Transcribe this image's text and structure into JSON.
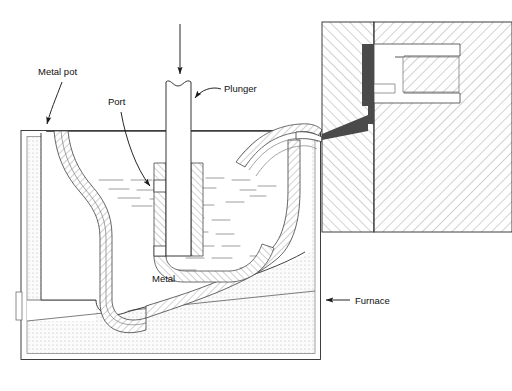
{
  "figure": {
    "type": "technical-cross-section-diagram",
    "background_color": "#ffffff",
    "line_color": "#2b2b2b",
    "hatch_color": "#8f8f8f",
    "sprue_color": "#4a4a4a",
    "stipple_color": "#b9b9b9",
    "liquid_color": "#9a9a9a"
  },
  "labels": [
    {
      "id": "metal-pot",
      "text": "Metal pot",
      "x": 38,
      "y": 75
    },
    {
      "id": "port",
      "text": "Port",
      "x": 108,
      "y": 105
    },
    {
      "id": "plunger",
      "text": "Plunger",
      "x": 224,
      "y": 90
    },
    {
      "id": "metal",
      "text": "Metal",
      "x": 152,
      "y": 280
    },
    {
      "id": "furnace",
      "text": "Furnace",
      "x": 355,
      "y": 303
    }
  ],
  "leaders": [
    {
      "id": "metal-pot-leader",
      "from": [
        62,
        80
      ],
      "to": [
        47,
        128
      ],
      "arrow": "down"
    },
    {
      "id": "port-leader",
      "from": [
        120,
        112
      ],
      "to": [
        152,
        190
      ],
      "arrow": "down-right"
    },
    {
      "id": "plunger-leader",
      "from": [
        220,
        92
      ],
      "to": [
        193,
        99
      ],
      "arrow": "left"
    },
    {
      "id": "furnace-leader",
      "from": [
        350,
        300
      ],
      "to": [
        322,
        300
      ],
      "arrow": "left"
    },
    {
      "id": "plunger-force-arrow",
      "from": [
        180,
        24
      ],
      "to": [
        180,
        78
      ],
      "arrow": "down"
    }
  ],
  "parts": {
    "plunger": {
      "name": "Plunger",
      "top_style": "break-line",
      "x": 165,
      "width": 26
    },
    "gooseneck": {
      "name": "Gooseneck channel",
      "fill": "hatched"
    },
    "port": {
      "name": "Port",
      "description": "inlet opening in gooseneck"
    },
    "metal_pot": {
      "name": "Metal pot",
      "fill": "hatched"
    },
    "molten_metal": {
      "name": "Metal",
      "fill": "dashed-liquid-lines"
    },
    "furnace": {
      "name": "Furnace",
      "fill": "stippled"
    },
    "die_block": {
      "name": "Die block",
      "fill": "diagonal-hatch",
      "parting_line": true
    },
    "die_cavity": {
      "name": "Die cavity",
      "fill": "hatched-outline"
    },
    "sprue": {
      "name": "Sprue / nozzle runner",
      "fill": "solid-dark"
    }
  }
}
